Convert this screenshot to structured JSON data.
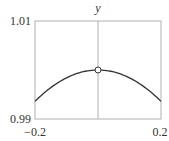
{
  "chart_data": {
    "type": "line",
    "title": "",
    "xlabel": "",
    "ylabel": "y",
    "xlim": [
      -0.2,
      0.2
    ],
    "ylim": [
      0.99,
      1.01
    ],
    "x_ticks": [
      "−0.2",
      "0.2"
    ],
    "y_ticks": [
      "0.99",
      "1.01"
    ],
    "grid": false,
    "series": [
      {
        "name": "y",
        "x": [
          -0.2,
          -0.15,
          -0.1,
          -0.05,
          0,
          0.05,
          0.1,
          0.15,
          0.2
        ],
        "values": [
          0.9936,
          0.9964,
          0.9984,
          0.9996,
          1.0,
          0.9996,
          0.9984,
          0.9964,
          0.9936
        ]
      }
    ],
    "annotations": [
      {
        "type": "open-circle-marker",
        "x": 0,
        "y": 1.0
      },
      {
        "type": "vertical-line",
        "x": 0
      }
    ],
    "colors": {
      "curve": "#333333",
      "frame": "#b0b0b0",
      "marker_fill": "#ffffff"
    }
  }
}
